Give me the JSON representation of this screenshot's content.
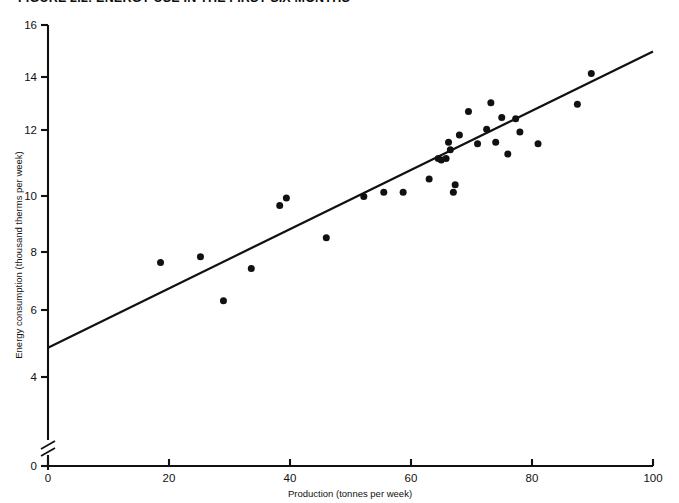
{
  "figure": {
    "title": "FIGURE 2.2: ENERGY USE IN THE FIRST SIX MONTHS"
  },
  "chart_data": {
    "type": "scatter",
    "title": "FIGURE 2.2: ENERGY USE IN THE FIRST SIX MONTHS",
    "xlabel": "Production (tonnes per week)",
    "ylabel": "Energy consumption (thousand therms per week)",
    "xlim": [
      0,
      100
    ],
    "ylim": [
      0,
      16
    ],
    "y_axis_break": true,
    "y_axis_break_between": [
      0,
      4
    ],
    "grid": false,
    "legend": null,
    "xticks": [
      0,
      20,
      40,
      60,
      80,
      100
    ],
    "yticks": [
      0,
      4,
      6,
      8,
      10,
      12,
      14,
      16
    ],
    "xtick_labels": [
      "0",
      "20",
      "40",
      "60",
      "80",
      "100"
    ],
    "ytick_labels": [
      "0",
      "4",
      "6",
      "8",
      "10",
      "12",
      "14",
      "16"
    ],
    "series": [
      {
        "name": "Observations",
        "marker": "filled-circle",
        "color": "#111111",
        "x": [
          18.6,
          25.2,
          29.0,
          33.6,
          38.3,
          39.4,
          46.0,
          52.2,
          55.5,
          58.7,
          63.0,
          64.5,
          65.0,
          65.8,
          66.2,
          66.5,
          67.0,
          67.3,
          68.0,
          69.5,
          71.0,
          72.5,
          73.2,
          74.0,
          75.0,
          76.0,
          77.3,
          78.0,
          81.0,
          87.5,
          89.8
        ],
        "y": [
          7.9,
          8.1,
          6.6,
          7.7,
          9.85,
          10.1,
          8.75,
          10.15,
          10.3,
          10.3,
          10.75,
          11.45,
          11.4,
          11.45,
          12.0,
          11.75,
          10.3,
          10.55,
          12.25,
          13.05,
          11.95,
          12.45,
          13.35,
          12.0,
          12.85,
          11.6,
          12.8,
          12.35,
          11.95,
          13.3,
          14.35
        ]
      }
    ],
    "fit_line": {
      "name": "Regression line",
      "color": "#111111",
      "x_start": 0,
      "y_start": 5.0,
      "x_end": 100,
      "y_end": 15.1
    }
  }
}
